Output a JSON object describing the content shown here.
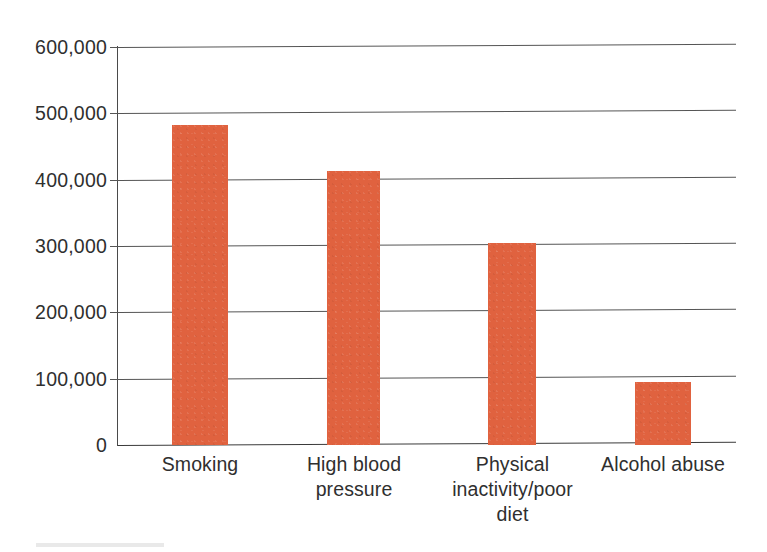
{
  "chart_data": {
    "type": "bar",
    "title": "",
    "subtitle": "",
    "xlabel": "",
    "ylabel": "",
    "categories": [
      "Smoking",
      "High blood pressure",
      "Physical inactivity/poor diet",
      "Alcohol abuse"
    ],
    "category_lines": [
      [
        "Smoking"
      ],
      [
        "High blood",
        "pressure"
      ],
      [
        "Physical",
        "inactivity/poor",
        "diet"
      ],
      [
        "Alcohol abuse"
      ]
    ],
    "values": [
      483000,
      413000,
      305000,
      95000
    ],
    "ylim": [
      0,
      600000
    ],
    "ytick_values": [
      0,
      100000,
      200000,
      300000,
      400000,
      500000,
      600000
    ],
    "ytick_labels": [
      "0",
      "100,000",
      "200,000",
      "300,000",
      "400,000",
      "500,000",
      "600,000"
    ],
    "grid": true,
    "grid_axis": "y",
    "legend": false,
    "legend_position": "none",
    "series": [
      {
        "name": "Deaths",
        "values": [
          483000,
          413000,
          305000,
          95000
        ]
      }
    ],
    "annotations": []
  },
  "style": {
    "bar_color": "#e0623f",
    "grid_color": "#555555",
    "axis_color": "#4a4a4a",
    "text_color": "#2f2f2f",
    "background": "#ffffff"
  }
}
